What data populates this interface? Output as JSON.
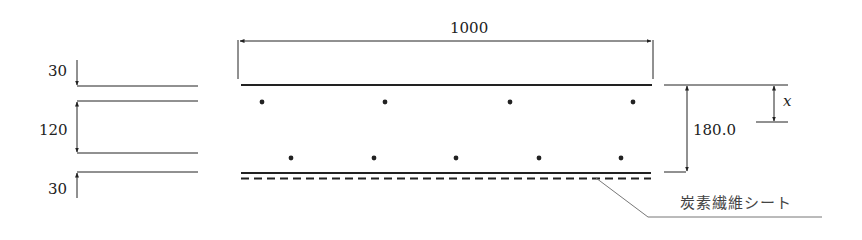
{
  "diagram": {
    "type": "cross-section",
    "width_dimension": "1000",
    "total_height": "180.0",
    "neutral_axis_label": "x",
    "left_layers": {
      "top_cover": "30",
      "middle": "120",
      "bottom_cover": "30"
    },
    "callout_label": "炭素繊維シート",
    "top_rebar_count": 4,
    "bottom_rebar_count": 5,
    "colors": {
      "line": "#222222",
      "leader": "#777777"
    }
  }
}
